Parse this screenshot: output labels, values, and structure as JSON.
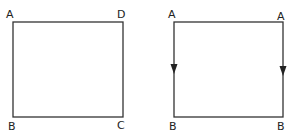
{
  "diagram": {
    "stroke_color": "#333333",
    "background": "#ffffff",
    "left_square": {
      "labels": {
        "top_left": "A",
        "top_right": "D",
        "bottom_left": "B",
        "bottom_right": "C"
      },
      "arrows": []
    },
    "right_square": {
      "labels": {
        "top_left": "A",
        "top_right": "A",
        "bottom_left": "B",
        "bottom_right": "B"
      },
      "arrows": [
        {
          "edge": "left",
          "direction": "down"
        },
        {
          "edge": "right",
          "direction": "down"
        }
      ]
    }
  }
}
